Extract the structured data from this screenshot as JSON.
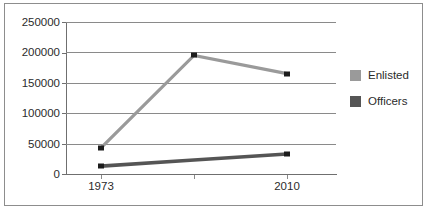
{
  "chart_data": {
    "type": "line",
    "title": "",
    "xlabel": "",
    "ylabel": "",
    "x": [
      "1973",
      "",
      "2010"
    ],
    "categories": [
      "1973",
      "",
      "2010"
    ],
    "tick_labels_x": [
      "1973",
      "",
      "2010"
    ],
    "tick_labels_y": [
      "0",
      "50000",
      "100000",
      "150000",
      "200000",
      "250000"
    ],
    "ylim": [
      0,
      250000
    ],
    "ytick_values": [
      0,
      50000,
      100000,
      150000,
      200000,
      250000
    ],
    "grid": true,
    "legend_position": "right",
    "series": [
      {
        "name": "Enlisted",
        "color": "#9a9a9a",
        "values": [
          43000,
          195000,
          165000
        ]
      },
      {
        "name": "Officers",
        "color": "#555555",
        "values": [
          13000,
          23000,
          33000
        ]
      }
    ]
  },
  "legend": {
    "items": [
      {
        "label": "Enlisted",
        "color": "#9a9a9a"
      },
      {
        "label": "Officers",
        "color": "#555555"
      }
    ]
  },
  "axes": {
    "y_labels": [
      "250000",
      "200000",
      "150000",
      "100000",
      "50000",
      "0"
    ],
    "x_labels": [
      "1973",
      "2010"
    ]
  }
}
